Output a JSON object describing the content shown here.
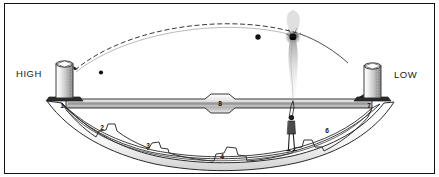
{
  "figure": {
    "type": "technical-line-diagram",
    "border": {
      "color": "#111111",
      "width_px": 1.3
    },
    "background": "#ffffff",
    "ink": "#222222"
  },
  "labels": {
    "high": "HIGH",
    "low": "LOW"
  },
  "zone_numbers": [
    {
      "id": "1",
      "text": "1",
      "x": 62,
      "y": 106,
      "note": "left tower base / inner band start"
    },
    {
      "id": "2",
      "text": "2",
      "x": 101,
      "y": 128,
      "note": "first outer notch, left"
    },
    {
      "id": "3",
      "text": "3",
      "x": 147,
      "y": 146,
      "note": "second outer notch, left"
    },
    {
      "id": "4",
      "text": "4",
      "x": 221,
      "y": 157,
      "note": "bottom centre notch"
    },
    {
      "id": "6",
      "text": "6",
      "x": 327,
      "y": 131,
      "note": "outer notch, right"
    },
    {
      "id": "7",
      "text": "7",
      "x": 369,
      "y": 105,
      "note": "right tower base"
    },
    {
      "id": "8",
      "text": "8",
      "x": 219,
      "y": 104,
      "note": "centre of horizontal band"
    }
  ],
  "elements": {
    "left_tower": {
      "name": "cylindrical-tower-high",
      "x": 56,
      "y": 60,
      "w": 17,
      "h": 42
    },
    "right_tower": {
      "name": "cylindrical-tower-low",
      "x": 364,
      "y": 62,
      "w": 17,
      "h": 40
    },
    "human_figure": {
      "name": "person-for-scale",
      "x": 288,
      "y": 112,
      "h": 40
    },
    "projectile_left": {
      "name": "projectile-ball-left",
      "x": 101,
      "y": 72,
      "r": 2.1
    },
    "projectile_right": {
      "name": "projectile-ball-right",
      "x": 258,
      "y": 37,
      "r": 2.6
    },
    "impact_burst": {
      "name": "impact-explosion",
      "x": 293,
      "y": 36,
      "r": 3.4
    },
    "smoke_plume": {
      "name": "smoke-plume",
      "x": 293,
      "y": 40,
      "h": 62
    },
    "trajectory": {
      "name": "dashed-trajectory-arc",
      "style": "dashed",
      "from_x": 74,
      "from_y": 70,
      "to_x": 345,
      "to_y": 62
    },
    "horizontal_band": {
      "name": "horizontal-shaded-band",
      "y": 102
    },
    "lens_outline": {
      "name": "lens-shaped-outline"
    }
  }
}
